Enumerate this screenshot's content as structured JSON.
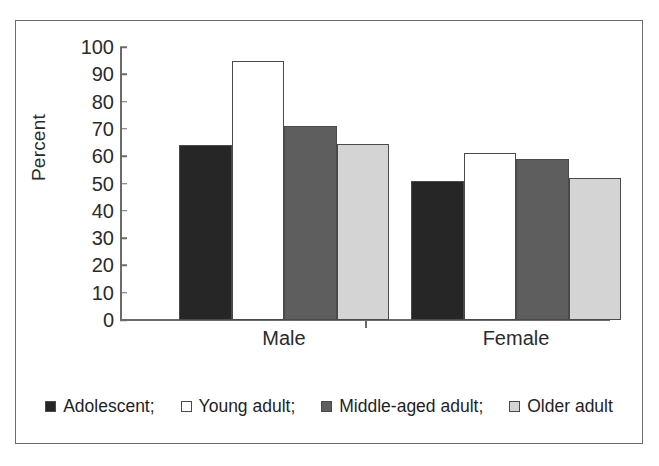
{
  "chart_data": {
    "type": "bar",
    "title": "",
    "xlabel": "",
    "ylabel": "Percent",
    "ylim": [
      0,
      100
    ],
    "ytick_step": 10,
    "yticks": [
      "100",
      "90",
      "80",
      "70",
      "60",
      "50",
      "40",
      "30",
      "20",
      "10",
      "0"
    ],
    "categories": [
      "Male",
      "Female"
    ],
    "grid": false,
    "legend_position": "bottom",
    "series": [
      {
        "name": "Adolescent;",
        "values": [
          64,
          51
        ],
        "color": "#262626"
      },
      {
        "name": "Young adult;",
        "values": [
          95,
          61
        ],
        "color": "#ffffff"
      },
      {
        "name": "Middle-aged adult;",
        "values": [
          71,
          59
        ],
        "color": "#5e5e5e"
      },
      {
        "name": "Older adult",
        "values": [
          64.5,
          52
        ],
        "color": "#d4d4d4"
      }
    ]
  },
  "colors": {
    "adolescent": "#262626",
    "young_adult": "#ffffff",
    "middle_aged_adult": "#5e5e5e",
    "older_adult": "#d4d4d4",
    "outline": "#4a4a4a",
    "axis": "#6b6b6b",
    "text": "#2b2b2b",
    "background": "#ffffff"
  }
}
